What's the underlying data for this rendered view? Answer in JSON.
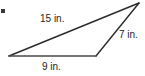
{
  "figure": {
    "type": "triangle-diagram",
    "background_color": "#ffffff",
    "stroke_color": "#2b2b2b",
    "text_color": "#232323",
    "width": 145,
    "height": 76,
    "vertices": {
      "left": {
        "x": 9,
        "y": 56
      },
      "bottom_right": {
        "x": 96,
        "y": 56
      },
      "apex": {
        "x": 139,
        "y": 3
      }
    },
    "sides": [
      {
        "id": "side-15",
        "name": "upper-long-side",
        "label": "15 in.",
        "value": 15,
        "unit": "in.",
        "from": "left",
        "to": "apex"
      },
      {
        "id": "side-7",
        "name": "right-side",
        "label": "7 in.",
        "value": 7,
        "unit": "in.",
        "from": "bottom_right",
        "to": "apex"
      },
      {
        "id": "side-9",
        "name": "bottom-side",
        "label": "9 in.",
        "value": 9,
        "unit": "in.",
        "from": "left",
        "to": "bottom_right"
      }
    ],
    "artifact": {
      "name": "bullet-mark",
      "x": 1,
      "y": 9
    }
  }
}
